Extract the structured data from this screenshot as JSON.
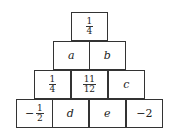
{
  "rows": [
    [
      {
        "type": "frac",
        "num": "1",
        "den": "4"
      }
    ],
    [
      {
        "type": "var",
        "text": "a"
      },
      {
        "type": "var",
        "text": "b"
      }
    ],
    [
      {
        "type": "frac",
        "num": "1",
        "den": "4"
      },
      {
        "type": "frac",
        "num": "11",
        "den": "12"
      },
      {
        "type": "var",
        "text": "c"
      }
    ],
    [
      {
        "type": "negfrac",
        "sign": "−",
        "num": "1",
        "den": "2"
      },
      {
        "type": "var",
        "text": "d"
      },
      {
        "type": "var",
        "text": "e"
      },
      {
        "type": "num",
        "text": "−2"
      }
    ]
  ]
}
